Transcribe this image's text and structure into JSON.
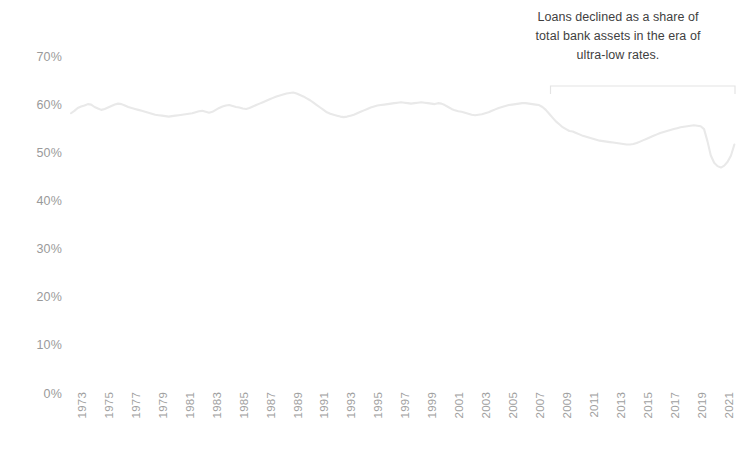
{
  "chart_data": {
    "type": "line",
    "title": "",
    "subtitle": "",
    "xlabel": "",
    "ylabel": "",
    "ylim": [
      0,
      70
    ],
    "xlim": [
      1973,
      2022
    ],
    "grid": false,
    "legend": null,
    "y_ticks": [
      "0%",
      "10%",
      "20%",
      "30%",
      "40%",
      "50%",
      "60%",
      "70%"
    ],
    "y_tick_values": [
      0,
      10,
      20,
      30,
      40,
      50,
      60,
      70
    ],
    "x_ticks": [
      "1973",
      "1975",
      "1977",
      "1979",
      "1981",
      "1983",
      "1985",
      "1987",
      "1989",
      "1991",
      "1993",
      "1995",
      "1997",
      "1999",
      "2001",
      "2003",
      "2005",
      "2007",
      "2009",
      "2011",
      "2013",
      "2015",
      "2017",
      "2019",
      "2021"
    ],
    "x_tick_values": [
      1973,
      1975,
      1977,
      1979,
      1981,
      1983,
      1985,
      1987,
      1989,
      1991,
      1993,
      1995,
      1997,
      1999,
      2001,
      2003,
      2005,
      2007,
      2009,
      2011,
      2013,
      2015,
      2017,
      2019,
      2021
    ],
    "series": [
      {
        "name": "Loans as a share of total bank assets",
        "color": "#e9e9e9",
        "x": [
          1973.0,
          1973.25,
          1973.5,
          1973.75,
          1974.0,
          1974.25,
          1974.5,
          1974.75,
          1975.0,
          1975.25,
          1975.5,
          1975.75,
          1976.0,
          1976.25,
          1976.5,
          1976.75,
          1977.0,
          1977.25,
          1977.5,
          1977.75,
          1978.0,
          1978.25,
          1978.5,
          1978.75,
          1979.0,
          1979.25,
          1979.5,
          1979.75,
          1980.0,
          1980.25,
          1980.5,
          1980.75,
          1981.0,
          1981.25,
          1981.5,
          1981.75,
          1982.0,
          1982.25,
          1982.5,
          1982.75,
          1983.0,
          1983.25,
          1983.5,
          1983.75,
          1984.0,
          1984.25,
          1984.5,
          1984.75,
          1985.0,
          1985.25,
          1985.5,
          1985.75,
          1986.0,
          1986.25,
          1986.5,
          1986.75,
          1987.0,
          1987.25,
          1987.5,
          1987.75,
          1988.0,
          1988.25,
          1988.5,
          1988.75,
          1989.0,
          1989.25,
          1989.5,
          1989.75,
          1990.0,
          1990.25,
          1990.5,
          1990.75,
          1991.0,
          1991.25,
          1991.5,
          1991.75,
          1992.0,
          1992.25,
          1992.5,
          1992.75,
          1993.0,
          1993.25,
          1993.5,
          1993.75,
          1994.0,
          1994.25,
          1994.5,
          1994.75,
          1995.0,
          1995.25,
          1995.5,
          1995.75,
          1996.0,
          1996.25,
          1996.5,
          1996.75,
          1997.0,
          1997.25,
          1997.5,
          1997.75,
          1998.0,
          1998.25,
          1998.5,
          1998.75,
          1999.0,
          1999.25,
          1999.5,
          1999.75,
          2000.0,
          2000.25,
          2000.5,
          2000.75,
          2001.0,
          2001.25,
          2001.5,
          2001.75,
          2002.0,
          2002.25,
          2002.5,
          2002.75,
          2003.0,
          2003.25,
          2003.5,
          2003.75,
          2004.0,
          2004.25,
          2004.5,
          2004.75,
          2005.0,
          2005.25,
          2005.5,
          2005.75,
          2006.0,
          2006.25,
          2006.5,
          2006.75,
          2007.0,
          2007.25,
          2007.5,
          2007.75,
          2008.0,
          2008.25,
          2008.5,
          2008.75,
          2009.0,
          2009.25,
          2009.5,
          2009.75,
          2010.0,
          2010.25,
          2010.5,
          2010.75,
          2011.0,
          2011.25,
          2011.5,
          2011.75,
          2012.0,
          2012.25,
          2012.5,
          2012.75,
          2013.0,
          2013.25,
          2013.5,
          2013.75,
          2014.0,
          2014.25,
          2014.5,
          2014.75,
          2015.0,
          2015.25,
          2015.5,
          2015.75,
          2016.0,
          2016.25,
          2016.5,
          2016.75,
          2017.0,
          2017.25,
          2017.5,
          2017.75,
          2018.0,
          2018.25,
          2018.5,
          2018.75,
          2019.0,
          2019.25,
          2019.5,
          2019.75,
          2020.0,
          2020.25,
          2020.5,
          2020.75,
          2021.0,
          2021.25,
          2021.5,
          2021.75,
          2022.0,
          2022.25
        ],
        "y": [
          58.3,
          58.8,
          59.4,
          59.7,
          59.9,
          60.2,
          60.1,
          59.6,
          59.3,
          59.0,
          59.2,
          59.5,
          59.8,
          60.1,
          60.3,
          60.2,
          59.9,
          59.6,
          59.4,
          59.2,
          59.0,
          58.8,
          58.6,
          58.4,
          58.2,
          58.0,
          57.9,
          57.8,
          57.7,
          57.6,
          57.7,
          57.8,
          57.9,
          58.0,
          58.1,
          58.2,
          58.3,
          58.5,
          58.7,
          58.8,
          58.6,
          58.4,
          58.6,
          59.0,
          59.4,
          59.7,
          59.9,
          60.0,
          59.8,
          59.6,
          59.5,
          59.3,
          59.2,
          59.4,
          59.7,
          60.0,
          60.3,
          60.6,
          60.9,
          61.2,
          61.5,
          61.8,
          62.0,
          62.2,
          62.4,
          62.5,
          62.6,
          62.4,
          62.1,
          61.8,
          61.4,
          61.0,
          60.5,
          60.0,
          59.5,
          59.0,
          58.5,
          58.2,
          58.0,
          57.8,
          57.6,
          57.5,
          57.6,
          57.8,
          58.0,
          58.3,
          58.6,
          58.9,
          59.2,
          59.5,
          59.7,
          59.9,
          60.0,
          60.1,
          60.2,
          60.3,
          60.4,
          60.5,
          60.6,
          60.5,
          60.4,
          60.3,
          60.4,
          60.5,
          60.6,
          60.5,
          60.4,
          60.3,
          60.2,
          60.4,
          60.3,
          60.0,
          59.6,
          59.2,
          58.9,
          58.7,
          58.6,
          58.4,
          58.2,
          58.0,
          57.9,
          58.0,
          58.1,
          58.3,
          58.5,
          58.8,
          59.1,
          59.4,
          59.6,
          59.8,
          60.0,
          60.1,
          60.2,
          60.3,
          60.4,
          60.4,
          60.3,
          60.2,
          60.1,
          60.0,
          59.6,
          59.0,
          58.2,
          57.4,
          56.6,
          56.0,
          55.4,
          55.0,
          54.6,
          54.5,
          54.2,
          53.9,
          53.6,
          53.4,
          53.2,
          53.0,
          52.8,
          52.6,
          52.5,
          52.4,
          52.3,
          52.2,
          52.1,
          52.0,
          51.9,
          51.8,
          51.8,
          51.9,
          52.1,
          52.4,
          52.7,
          53.0,
          53.3,
          53.6,
          53.9,
          54.2,
          54.4,
          54.6,
          54.8,
          55.0,
          55.2,
          55.4,
          55.5,
          55.6,
          55.7,
          55.8,
          55.7,
          55.6,
          55.0,
          52.5,
          49.5,
          48.0,
          47.3,
          47.0,
          47.4,
          48.2,
          49.5,
          51.8
        ]
      }
    ],
    "annotations": [
      {
        "text": "Loans declined as a share of\ntotal bank assets in the era of\nultra-low rates.",
        "bracket_from": 2008.6,
        "bracket_to": 2022.3
      }
    ]
  }
}
